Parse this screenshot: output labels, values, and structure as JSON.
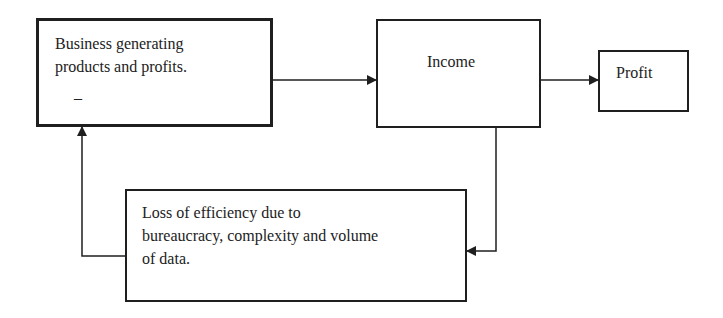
{
  "diagram": {
    "nodes": {
      "business": {
        "line1": "Business generating",
        "line2": "products and profits.",
        "mark": "_"
      },
      "income": {
        "label": "Income"
      },
      "profit": {
        "label": "Profit"
      },
      "loss": {
        "line1": "Loss of efficiency due to",
        "line2": "bureaucracy, complexity and volume",
        "line3": "of data."
      }
    },
    "edges": [
      {
        "from": "business",
        "to": "income"
      },
      {
        "from": "income",
        "to": "profit"
      },
      {
        "from": "income",
        "to": "loss"
      },
      {
        "from": "loss",
        "to": "business"
      }
    ],
    "colors": {
      "stroke": "#1f1f1f",
      "background": "#ffffff"
    }
  }
}
